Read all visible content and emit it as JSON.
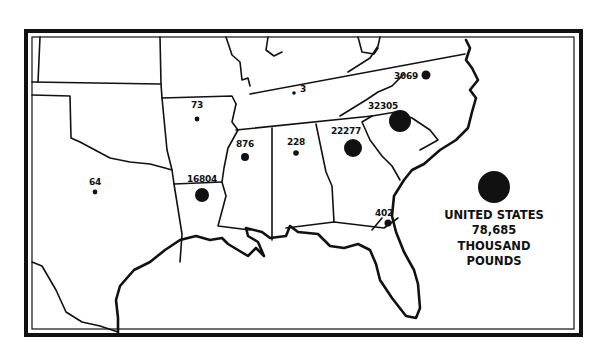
{
  "map": {
    "type": "proportional-symbol",
    "region": "Southeastern United States",
    "unit": "thousand pounds",
    "colors": {
      "ink": "#111111",
      "background": "#ffffff"
    }
  },
  "states": [
    {
      "name": "Texas",
      "label": "64",
      "value": 64
    },
    {
      "name": "Arkansas",
      "label": "73",
      "value": 73
    },
    {
      "name": "Louisiana",
      "label": "16804",
      "value": 16804
    },
    {
      "name": "Mississippi",
      "label": "876",
      "value": 876
    },
    {
      "name": "Alabama",
      "label": "228",
      "value": 228
    },
    {
      "name": "Tennessee",
      "label": "3",
      "value": 3
    },
    {
      "name": "Georgia",
      "label": "22277",
      "value": 22277
    },
    {
      "name": "South Carolina",
      "label": "32305",
      "value": 32305
    },
    {
      "name": "North Carolina",
      "label": "3069",
      "value": 3069
    },
    {
      "name": "Florida",
      "label": "402",
      "value": 402
    }
  ],
  "legend": {
    "line1": "UNITED STATES",
    "line2": "78,685",
    "line3": "THOUSAND",
    "line4": "POUNDS",
    "total": 78685
  }
}
